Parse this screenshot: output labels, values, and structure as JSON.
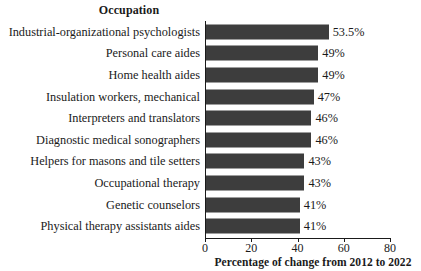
{
  "header": {
    "column_title": "Occupation"
  },
  "axis": {
    "x_title": "Percentage of change from 2012 to 2022",
    "ticks": [
      "0",
      "20",
      "40",
      "60",
      "80"
    ]
  },
  "chart_data": {
    "type": "bar",
    "orientation": "horizontal",
    "title": "Occupation",
    "xlabel": "Percentage of change from 2012 to 2022",
    "ylabel": "Occupation",
    "xlim": [
      0,
      80
    ],
    "xticks": [
      0,
      20,
      40,
      60,
      80
    ],
    "grid": false,
    "legend": "none",
    "bar_color": "#3d3d3d",
    "categories": [
      "Industrial-organizational psychologists",
      "Personal care aides",
      "Home health aides",
      "Insulation workers, mechanical",
      "Interpreters and translators",
      "Diagnostic medical sonographers",
      "Helpers for masons and tile setters",
      "Occupational therapy",
      "Genetic counselors",
      "Physical therapy assistants aides"
    ],
    "values": [
      53.5,
      49,
      49,
      47,
      46,
      46,
      43,
      43,
      41,
      41
    ],
    "value_labels": [
      "53.5%",
      "49%",
      "49%",
      "47%",
      "46%",
      "46%",
      "43%",
      "43%",
      "41%",
      "41%"
    ]
  }
}
